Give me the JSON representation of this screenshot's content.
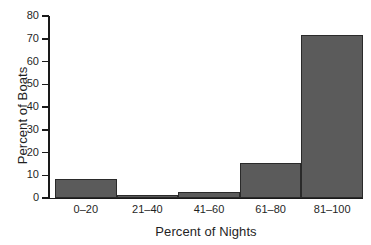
{
  "chart_data": {
    "type": "bar",
    "title": "",
    "subtitle": "",
    "xlabel": "Percent of Nights",
    "ylabel": "Percent of Boats",
    "categories": [
      "0–20",
      "21–40",
      "41–60",
      "61–80",
      "81–100"
    ],
    "values": [
      8.5,
      1.5,
      2.5,
      15.2,
      71.5
    ],
    "ylim": [
      0,
      80
    ],
    "yticks": [
      0,
      10,
      20,
      30,
      40,
      50,
      60,
      70,
      80
    ],
    "ytick_labels": [
      "0",
      "10",
      "20",
      "30",
      "40",
      "50",
      "60",
      "70",
      "80"
    ],
    "grid": false,
    "legend": false,
    "legend_position": "none",
    "bar_color": "#5b5b5b",
    "bar_edge_color": "#2a2a2a",
    "axis_color": "#1a1a1a",
    "background_color": "#ffffff"
  },
  "axes": {
    "y_title": "Percent of Boats",
    "x_title": "Percent of Nights"
  }
}
